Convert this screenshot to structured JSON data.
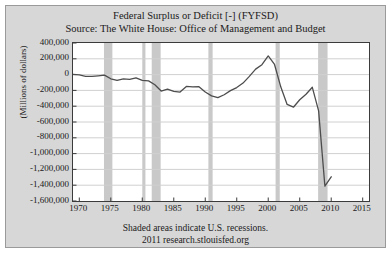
{
  "chart_data": {
    "type": "line",
    "title": "Federal Surplus or Deficit [-] (FYFSD)",
    "subtitle": "Source: The White House: Office of Management and Budget",
    "xlabel": "",
    "ylabel": "(Millions of dollars)",
    "xlim": [
      1969,
      2016
    ],
    "ylim": [
      -1600000,
      400000
    ],
    "grid": true,
    "legend": null,
    "ytick_labels": [
      "400,000",
      "200,000",
      "0",
      "-200,000",
      "-400,000",
      "-600,000",
      "-800,000",
      "-1,000,000",
      "-1,200,000",
      "-1,400,000",
      "-1,600,000"
    ],
    "yticks": [
      400000,
      200000,
      0,
      -200000,
      -400000,
      -600000,
      -800000,
      -1000000,
      -1200000,
      -1400000,
      -1600000
    ],
    "xtick_labels": [
      "1970",
      "1975",
      "1980",
      "1985",
      "1990",
      "1995",
      "2000",
      "2005",
      "2010",
      "2015"
    ],
    "xticks": [
      1970,
      1975,
      1980,
      1985,
      1990,
      1995,
      2000,
      2005,
      2010,
      2015
    ],
    "series": [
      {
        "name": "Federal Surplus or Deficit [-]",
        "color": "#4d4d4d",
        "x": [
          1969,
          1970,
          1971,
          1972,
          1973,
          1974,
          1975,
          1976,
          1977,
          1978,
          1979,
          1980,
          1981,
          1982,
          1983,
          1984,
          1985,
          1986,
          1987,
          1988,
          1989,
          1990,
          1991,
          1992,
          1993,
          1994,
          1995,
          1996,
          1997,
          1998,
          1999,
          2000,
          2001,
          2002,
          2003,
          2004,
          2005,
          2006,
          2007,
          2008,
          2009,
          2010
        ],
        "y": [
          3242,
          -2842,
          -23033,
          -23373,
          -14908,
          -6135,
          -53242,
          -73732,
          -53659,
          -59186,
          -40726,
          -73830,
          -78968,
          -127977,
          -207802,
          -185367,
          -212308,
          -221227,
          -149730,
          -155178,
          -152639,
          -221036,
          -269238,
          -290321,
          -255051,
          -203186,
          -163952,
          -107431,
          -21884,
          69270,
          125610,
          236241,
          128236,
          -157758,
          -377585,
          -412727,
          -318346,
          -248181,
          -160701,
          -458553,
          -1412688,
          -1293489
        ]
      }
    ],
    "recession_bands": [
      {
        "start": 1973.92,
        "end": 1975.25
      },
      {
        "start": 1980.0,
        "end": 1980.5
      },
      {
        "start": 1981.5,
        "end": 1982.92
      },
      {
        "start": 1990.5,
        "end": 1991.17
      },
      {
        "start": 2001.17,
        "end": 2001.83
      },
      {
        "start": 2007.92,
        "end": 2009.42
      }
    ],
    "annotations": [
      "Shaded areas indicate U.S. recessions.",
      "2011 research.stlouisfed.org"
    ],
    "colors": {
      "panel_background": "#d7d7d7",
      "plot_background": "#ffffff",
      "line": "#4d4d4d",
      "recession_shading": "#c9c9c9",
      "gridline": "#d0d0d0",
      "axis": "#3b3b3b",
      "text": "#1a1a1a"
    }
  },
  "footer": {
    "line1": "Shaded areas indicate U.S. recessions.",
    "line2": "2011 research.stlouisfed.org"
  }
}
